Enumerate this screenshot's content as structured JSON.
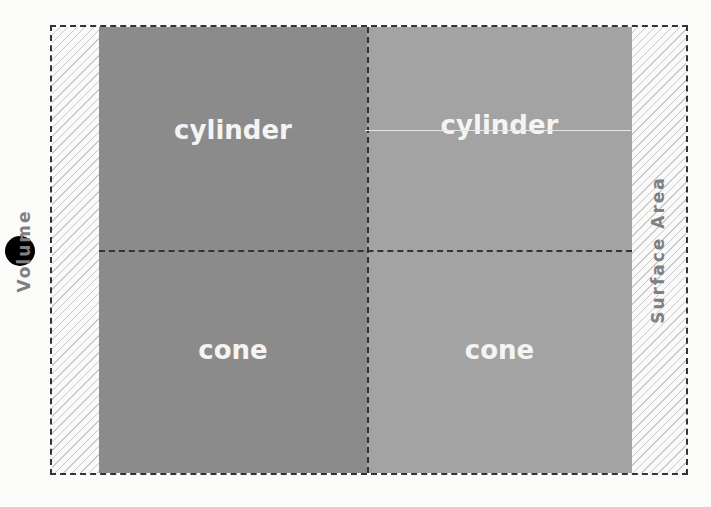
{
  "diagram": {
    "axes": {
      "left": "Volume",
      "right": "Surface Area"
    },
    "cells": [
      {
        "row": 0,
        "col": 0,
        "label": "cylinder",
        "color": "#8b8b8b"
      },
      {
        "row": 0,
        "col": 1,
        "label": "cylinder",
        "color": "#a3a3a3"
      },
      {
        "row": 1,
        "col": 0,
        "label": "cone",
        "color": "#8b8b8b"
      },
      {
        "row": 1,
        "col": 1,
        "label": "cone",
        "color": "#a3a3a3"
      }
    ],
    "marker": "black-dot"
  }
}
